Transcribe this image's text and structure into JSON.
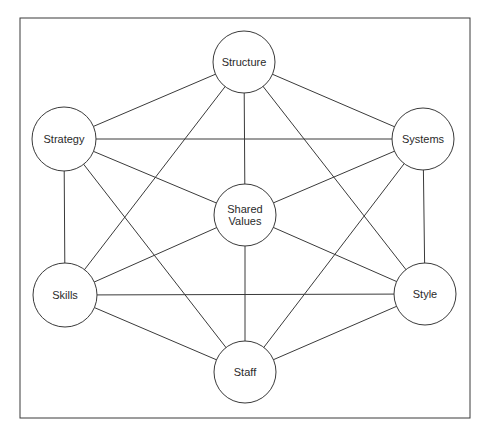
{
  "diagram": {
    "nodes": [
      {
        "id": "structure",
        "label": "Structure",
        "lines": [
          "Structure"
        ],
        "cx": 244,
        "cy": 62,
        "r": 31
      },
      {
        "id": "strategy",
        "label": "Strategy",
        "lines": [
          "Strategy"
        ],
        "cx": 64,
        "cy": 139,
        "r": 32
      },
      {
        "id": "systems",
        "label": "Systems",
        "lines": [
          "Systems"
        ],
        "cx": 423,
        "cy": 139,
        "r": 31
      },
      {
        "id": "shared-values",
        "label": "Shared Values",
        "lines": [
          "Shared",
          "Values"
        ],
        "cx": 245,
        "cy": 215,
        "r": 31
      },
      {
        "id": "skills",
        "label": "Skills",
        "lines": [
          "Skills"
        ],
        "cx": 65,
        "cy": 295,
        "r": 32
      },
      {
        "id": "style",
        "label": "Style",
        "lines": [
          "Style"
        ],
        "cx": 425,
        "cy": 294,
        "r": 31
      },
      {
        "id": "staff",
        "label": "Staff",
        "lines": [
          "Staff"
        ],
        "cx": 245,
        "cy": 372,
        "r": 31
      }
    ],
    "edges": [
      [
        "structure",
        "strategy"
      ],
      [
        "structure",
        "systems"
      ],
      [
        "structure",
        "shared-values"
      ],
      [
        "structure",
        "skills"
      ],
      [
        "structure",
        "style"
      ],
      [
        "strategy",
        "systems"
      ],
      [
        "strategy",
        "shared-values"
      ],
      [
        "strategy",
        "skills"
      ],
      [
        "strategy",
        "staff"
      ],
      [
        "systems",
        "shared-values"
      ],
      [
        "systems",
        "style"
      ],
      [
        "systems",
        "staff"
      ],
      [
        "shared-values",
        "skills"
      ],
      [
        "shared-values",
        "style"
      ],
      [
        "shared-values",
        "staff"
      ],
      [
        "skills",
        "style"
      ],
      [
        "skills",
        "staff"
      ],
      [
        "style",
        "staff"
      ]
    ],
    "colors": {
      "stroke": "#3a3a3a",
      "fill": "#ffffff",
      "text": "#2a2a2a"
    }
  }
}
